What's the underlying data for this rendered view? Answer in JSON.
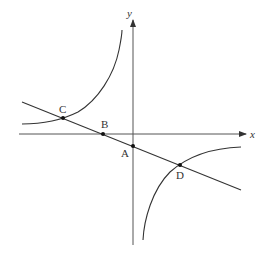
{
  "figure": {
    "type": "coordinate-plane-diagram",
    "colors": {
      "stroke": "#333333",
      "background": "#ffffff"
    }
  },
  "axes": {
    "x_label": "x",
    "y_label": "y"
  },
  "points": [
    {
      "id": "C",
      "label": "C",
      "desc": "intersection of line and hyperbola (upper-left branch)"
    },
    {
      "id": "B",
      "label": "B",
      "desc": "line meets x-axis"
    },
    {
      "id": "A",
      "label": "A",
      "desc": "line meets y-axis"
    },
    {
      "id": "D",
      "label": "D",
      "desc": "intersection of line and hyperbola (lower-right branch)"
    }
  ]
}
